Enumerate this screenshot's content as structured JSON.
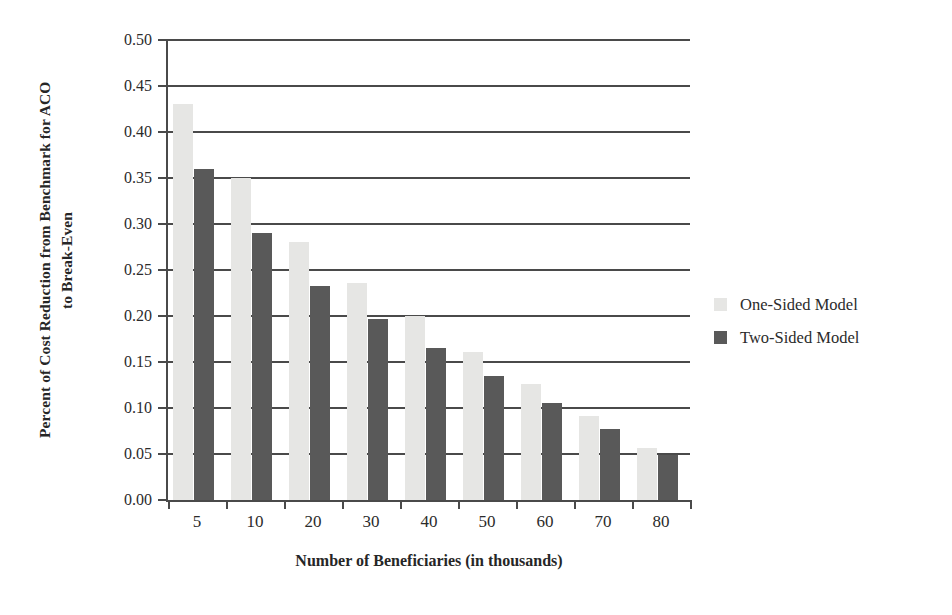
{
  "chart_data": {
    "type": "bar",
    "title": "",
    "xlabel": "Number of Beneficiaries (in thousands)",
    "ylabel": "Percent of Cost Reduction from Benchmark for ACO to Break-Even",
    "ylabel_line1": "Percent of Cost Reduction from Benchmark for ACO",
    "ylabel_line2": "to Break-Even",
    "categories": [
      "5",
      "10",
      "20",
      "30",
      "40",
      "50",
      "60",
      "70",
      "80"
    ],
    "series": [
      {
        "name": "One-Sided Model",
        "color": "#e6e6e4",
        "values": [
          0.43,
          0.35,
          0.28,
          0.236,
          0.2,
          0.161,
          0.126,
          0.091,
          0.056
        ]
      },
      {
        "name": "Two-Sided Model",
        "color": "#595959",
        "values": [
          0.36,
          0.29,
          0.233,
          0.197,
          0.165,
          0.135,
          0.105,
          0.077,
          0.049
        ]
      }
    ],
    "ylim": [
      0.0,
      0.5
    ],
    "ytick_values": [
      0.0,
      0.05,
      0.1,
      0.15,
      0.2,
      0.25,
      0.3,
      0.35,
      0.4,
      0.45,
      0.5
    ],
    "ytick_labels": [
      "0.00",
      "0.05",
      "0.10",
      "0.15",
      "0.20",
      "0.25",
      "0.30",
      "0.35",
      "0.40",
      "0.45",
      "0.50"
    ],
    "grid": "horizontal",
    "legend_position": "right",
    "legend_entries": [
      "One-Sided Model",
      "Two-Sided Model"
    ]
  },
  "style": {
    "background": "#ffffff",
    "axis_color": "#4a4a4a",
    "text_color": "#2b2b2b"
  }
}
